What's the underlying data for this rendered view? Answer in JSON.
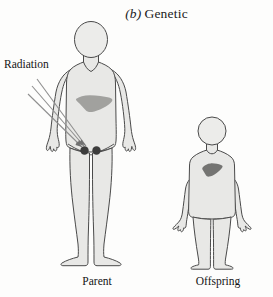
{
  "figure": {
    "part_letter": "(b)",
    "title": "Genetic",
    "caption_full": "(b) Genetic"
  },
  "labels": {
    "radiation": "Radiation",
    "parent": "Parent",
    "offspring": "Offspring"
  },
  "colors": {
    "background": "#fdfdfc",
    "body_fill": "#e8e8e6",
    "body_outline": "#4a4a4a",
    "liver_fill": "#9a9a98",
    "child_liver_fill": "#6e6e6c",
    "gonad_fill": "#3c3c3c",
    "ray_stroke": "#8c8c8c",
    "text": "#141414"
  },
  "diagram": {
    "type": "biological-illustration",
    "figures": [
      {
        "name": "parent",
        "label": "Parent",
        "kind": "adult-human-body",
        "organs": [
          {
            "name": "liver",
            "shaded": true,
            "tone": "medium-gray"
          },
          {
            "name": "gonads",
            "shaded": true,
            "tone": "dark",
            "count": 2,
            "is_target": true
          }
        ]
      },
      {
        "name": "offspring",
        "label": "Offspring",
        "kind": "child-human-body",
        "organs": [
          {
            "name": "liver",
            "shaded": true,
            "tone": "dark-gray",
            "is_affected": true
          }
        ]
      }
    ],
    "rays": {
      "name": "radiation-rays",
      "count": 3,
      "origin": "upper-left",
      "target": "parent-gonads"
    }
  }
}
